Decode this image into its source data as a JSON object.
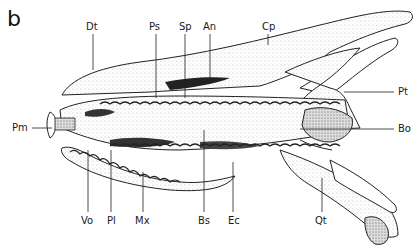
{
  "figure": {
    "panel_letter": "b",
    "labels": {
      "top": [
        "Dt",
        "Ps",
        "Sp",
        "An",
        "Cp"
      ],
      "right": [
        "Pt",
        "Bo"
      ],
      "left": [
        "Pm"
      ],
      "bottom": [
        "Vo",
        "Pl",
        "Mx",
        "Bs",
        "Ec",
        "Qt"
      ]
    },
    "label_list": [
      {
        "id": "Dt",
        "text": "Dt",
        "x": 86,
        "y": 22
      },
      {
        "id": "Ps",
        "text": "Ps",
        "x": 150,
        "y": 22
      },
      {
        "id": "Sp",
        "text": "Sp",
        "x": 180,
        "y": 22
      },
      {
        "id": "An",
        "text": "An",
        "x": 203,
        "y": 22
      },
      {
        "id": "Cp",
        "text": "Cp",
        "x": 262,
        "y": 22
      },
      {
        "id": "Pt",
        "text": "Pt",
        "x": 398,
        "y": 87
      },
      {
        "id": "Bo",
        "text": "Bo",
        "x": 398,
        "y": 125
      },
      {
        "id": "Pm",
        "text": "Pm",
        "x": 12,
        "y": 124
      },
      {
        "id": "Vo",
        "text": "Vo",
        "x": 82,
        "y": 216
      },
      {
        "id": "Pl",
        "text": "Pl",
        "x": 107,
        "y": 216
      },
      {
        "id": "Mx",
        "text": "Mx",
        "x": 135,
        "y": 216
      },
      {
        "id": "Bs",
        "text": "Bs",
        "x": 198,
        "y": 216
      },
      {
        "id": "Ec",
        "text": "Ec",
        "x": 228,
        "y": 216
      },
      {
        "id": "Qt",
        "text": "Qt",
        "x": 314,
        "y": 216
      }
    ]
  }
}
